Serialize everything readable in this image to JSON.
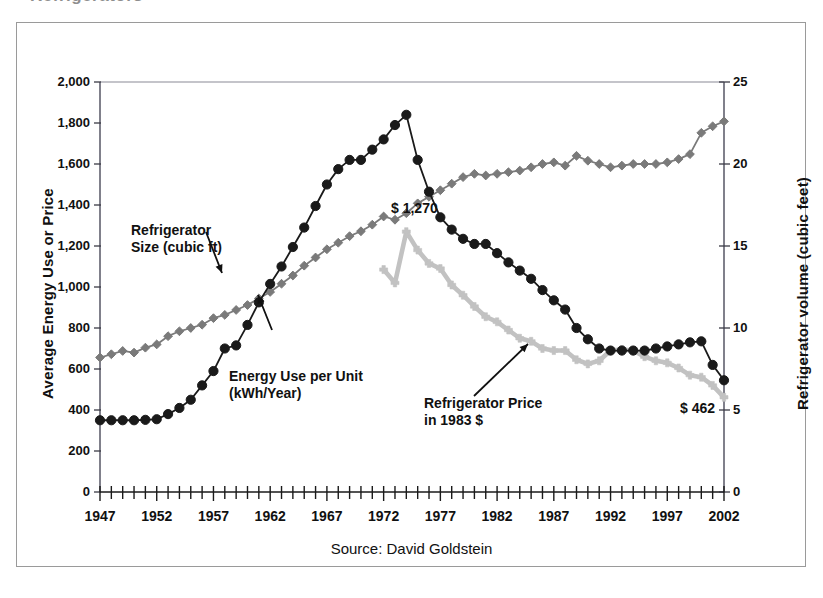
{
  "figure": {
    "top_cut_text": "Refrigerators",
    "source_note": "Source: David Goldstein",
    "frame_color": "#9a9a9a"
  },
  "annotations": {
    "size_label_line1": "Refrigerator",
    "size_label_line2": "Size (cubic ft)",
    "energy_label_line1": "Energy Use per Unit",
    "energy_label_line2": "(kWh/Year)",
    "price_label_line1": "Refrigerator Price",
    "price_label_line2": "in 1983 $",
    "price_peak_label": "$ 1,270",
    "price_end_label": "$ 462"
  },
  "chart_data": {
    "type": "line",
    "title": "",
    "xlabel": "",
    "ylabel": "Average Energy Use or Price",
    "y2label": "Refrigerator volume (cubic feet)",
    "xlim": [
      1947,
      2002
    ],
    "ylim": [
      0,
      2000
    ],
    "y2lim": [
      0,
      25
    ],
    "yticks": [
      0,
      200,
      400,
      600,
      800,
      1000,
      1200,
      1400,
      1600,
      1800,
      2000
    ],
    "ytick_labels": [
      "0",
      "200",
      "400",
      "600",
      "800",
      "1,000",
      "1,200",
      "1,400",
      "1,600",
      "1,800",
      "2,000"
    ],
    "y2ticks": [
      0,
      5,
      10,
      15,
      20,
      25
    ],
    "y2tick_labels": [
      "0",
      "5",
      "10",
      "15",
      "20",
      "25"
    ],
    "xticks": [
      1947,
      1952,
      1957,
      1962,
      1967,
      1972,
      1977,
      1982,
      1987,
      1992,
      1997,
      2002
    ],
    "xtick_labels": [
      "1947",
      "1952",
      "1957",
      "1962",
      "1967",
      "1972",
      "1977",
      "1982",
      "1987",
      "1992",
      "1997",
      "2002"
    ],
    "x_minor_tick_interval": 1,
    "grid": false,
    "legend": "annotations",
    "series": [
      {
        "name": "Energy Use per Unit (kWh/Year)",
        "axis": "left",
        "color": "#1a1a1a",
        "marker": "circle",
        "x": [
          1947,
          1948,
          1949,
          1950,
          1951,
          1952,
          1953,
          1954,
          1955,
          1956,
          1957,
          1958,
          1959,
          1960,
          1961,
          1962,
          1963,
          1964,
          1965,
          1966,
          1967,
          1968,
          1969,
          1970,
          1971,
          1972,
          1973,
          1974,
          1975,
          1976,
          1977,
          1978,
          1979,
          1980,
          1981,
          1982,
          1983,
          1984,
          1985,
          1986,
          1987,
          1988,
          1989,
          1990,
          1991,
          1992,
          1993,
          1994,
          1995,
          1996,
          1997,
          1998,
          1999,
          2000,
          2001,
          2002
        ],
        "y": [
          350,
          350,
          350,
          350,
          352,
          355,
          380,
          410,
          450,
          520,
          590,
          700,
          715,
          815,
          925,
          1015,
          1100,
          1195,
          1290,
          1395,
          1500,
          1575,
          1620,
          1620,
          1670,
          1720,
          1790,
          1840,
          1620,
          1465,
          1340,
          1280,
          1235,
          1210,
          1210,
          1165,
          1120,
          1080,
          1040,
          985,
          935,
          890,
          800,
          745,
          700,
          690,
          690,
          690,
          690,
          700,
          710,
          720,
          730,
          735,
          620,
          545
        ]
      },
      {
        "name": "Refrigerator Size (cubic ft)",
        "axis": "right",
        "color": "#7a7a7a",
        "marker": "diamond",
        "x": [
          1947,
          1948,
          1949,
          1950,
          1951,
          1952,
          1953,
          1954,
          1955,
          1956,
          1957,
          1958,
          1959,
          1960,
          1961,
          1962,
          1963,
          1964,
          1965,
          1966,
          1967,
          1968,
          1969,
          1970,
          1971,
          1972,
          1973,
          1974,
          1975,
          1976,
          1977,
          1978,
          1979,
          1980,
          1981,
          1982,
          1983,
          1984,
          1985,
          1986,
          1987,
          1988,
          1989,
          1990,
          1991,
          1992,
          1993,
          1994,
          1995,
          1996,
          1997,
          1998,
          1999,
          2000,
          2001,
          2002
        ],
        "y": [
          8.2,
          8.4,
          8.6,
          8.5,
          8.8,
          9.0,
          9.5,
          9.8,
          10.0,
          10.2,
          10.6,
          10.8,
          11.1,
          11.4,
          11.8,
          12.2,
          12.7,
          13.2,
          13.8,
          14.3,
          14.8,
          15.2,
          15.6,
          15.9,
          16.3,
          16.8,
          16.6,
          17.0,
          17.6,
          18.0,
          18.4,
          18.8,
          19.2,
          19.4,
          19.3,
          19.4,
          19.5,
          19.6,
          19.8,
          20.0,
          20.1,
          19.9,
          20.5,
          20.2,
          20.0,
          19.8,
          19.9,
          20.0,
          20.0,
          20.0,
          20.1,
          20.3,
          20.6,
          21.9,
          22.3,
          22.6
        ]
      },
      {
        "name": "Refrigerator Price in 1983 $",
        "axis": "left",
        "color": "#c2c2c2",
        "marker": "cross",
        "x": [
          1972,
          1973,
          1974,
          1975,
          1976,
          1977,
          1978,
          1979,
          1980,
          1981,
          1982,
          1983,
          1984,
          1985,
          1986,
          1987,
          1988,
          1989,
          1990,
          1991,
          1992,
          1993,
          1994,
          1995,
          1996,
          1997,
          1998,
          1999,
          2000,
          2001,
          2002
        ],
        "y": [
          1085,
          1020,
          1270,
          1180,
          1115,
          1090,
          1010,
          960,
          905,
          855,
          830,
          790,
          750,
          735,
          700,
          690,
          690,
          645,
          625,
          640,
          690,
          695,
          690,
          660,
          640,
          630,
          605,
          570,
          560,
          520,
          462
        ]
      }
    ]
  }
}
